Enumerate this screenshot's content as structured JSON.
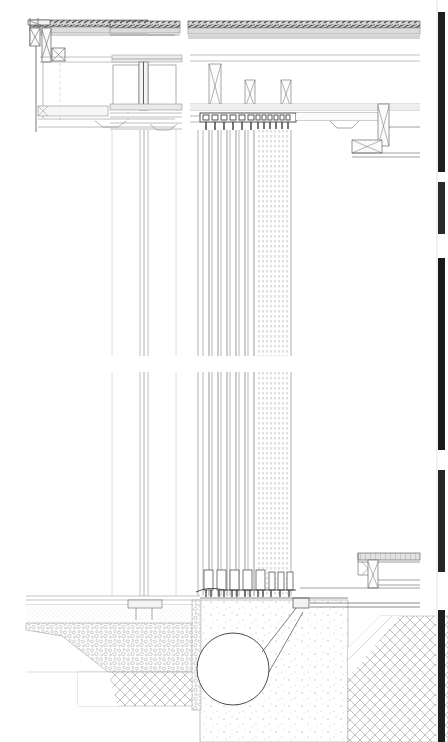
{
  "document": {
    "type": "architectural-section-drawing",
    "title": "Curtain Wall / Cable Facade Vertical Section Detail",
    "background_color": "#ffffff",
    "line_color": "#6e6e6e",
    "dark_line_color": "#3a3a3a",
    "hatch_color": "#b8b8b8",
    "width_px": 448,
    "height_px": 742
  },
  "drawing": {
    "sheet_label": "",
    "scale_note": "",
    "panels": [
      {
        "name": "roof-parapet-detail",
        "label": "",
        "description": "Parapet cap, coping flashing and edge beam at top left"
      },
      {
        "name": "mullion-head-detail",
        "label": "",
        "description": "Central glazing mullion head connection with box section"
      },
      {
        "name": "cable-anchor-head-detail",
        "label": "",
        "description": "Top anchorage plate with cluster of tension rods"
      },
      {
        "name": "canopy-bracket-detail",
        "label": "",
        "description": "Right hand canopy / outrigger bracket"
      },
      {
        "name": "mullion-shaft",
        "label": "",
        "description": "Continuous vertical mullion profile"
      },
      {
        "name": "cable-bundle-shaft",
        "label": "",
        "description": "Bundle of vertical tension cables with dashed hidden lines"
      },
      {
        "name": "foundation-detail",
        "label": "",
        "description": "Ground slab, gravel fill, concrete footing and cross hatched earth"
      },
      {
        "name": "drain-pipe",
        "label": "",
        "description": "Circular drainage pipe section in footing"
      }
    ],
    "ground_layers": [
      {
        "name": "finished-floor",
        "pattern": "solid-thin-band"
      },
      {
        "name": "screed-layer",
        "pattern": "fine-stipple"
      },
      {
        "name": "gravel-fill",
        "pattern": "aggregate-stipple"
      },
      {
        "name": "concrete-footing",
        "pattern": "dot-stipple"
      },
      {
        "name": "compacted-earth",
        "pattern": "cross-hatch-45"
      }
    ],
    "slab_bands": [
      {
        "name": "roof-slab",
        "y": 22
      },
      {
        "name": "ceiling-band",
        "y": 58
      },
      {
        "name": "floor-slab",
        "y": 108
      },
      {
        "name": "soffit-band",
        "y": 124
      }
    ],
    "cable_count": 12,
    "mullion_count": 3,
    "right_margin_bars": [
      {
        "name": "margin-bar-1",
        "top": 12,
        "height": 160
      },
      {
        "name": "margin-bar-2",
        "top": 182,
        "height": 52
      },
      {
        "name": "margin-bar-3",
        "top": 258,
        "height": 192
      },
      {
        "name": "margin-bar-4",
        "top": 470,
        "height": 102
      },
      {
        "name": "margin-bar-5",
        "top": 610,
        "height": 132
      }
    ]
  }
}
